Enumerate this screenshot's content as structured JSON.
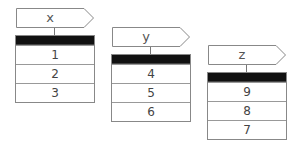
{
  "variables": [
    {
      "name": "x",
      "values": [
        "1",
        "2",
        "3"
      ]
    },
    {
      "name": "y",
      "values": [
        "4",
        "5",
        "6"
      ]
    },
    {
      "name": "z",
      "values": [
        "9",
        "8",
        "7"
      ]
    }
  ]
}
